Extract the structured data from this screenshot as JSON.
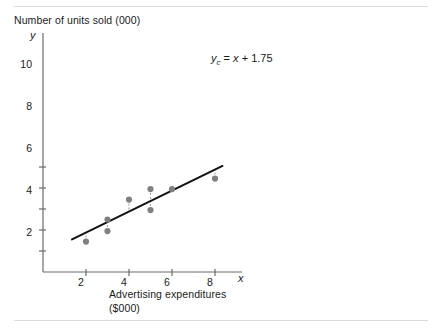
{
  "chart_data": {
    "type": "scatter",
    "title": "Number of units sold (000)",
    "xlabel": "Advertising expenditures",
    "xlabel_units": "($000)",
    "ylabel": "Number of units sold (000)",
    "x_axis_letter": "x",
    "y_axis_letter": "y",
    "xticks": [
      2,
      4,
      6,
      8
    ],
    "yticks": [
      2,
      4,
      6,
      8,
      10
    ],
    "xlim": [
      0,
      9.2
    ],
    "ylim": [
      0,
      11.2
    ],
    "grid": false,
    "legend": null,
    "annotations": [
      {
        "text": "yc = x + 1.75",
        "display": {
          "lead": "y",
          "sub": "c",
          "rest_eq": "=",
          "rest_var": "x",
          "rest_plus": "+",
          "rest_const": "1.75"
        },
        "x": 8.1,
        "y": 10.2
      }
    ],
    "points": [
      {
        "x": 2,
        "y": 2.9
      },
      {
        "x": 3,
        "y": 5.0
      },
      {
        "x": 3,
        "y": 3.9
      },
      {
        "x": 4,
        "y": 6.9
      },
      {
        "x": 5,
        "y": 7.9
      },
      {
        "x": 5,
        "y": 5.9
      },
      {
        "x": 6,
        "y": 7.9
      },
      {
        "x": 8,
        "y": 8.9
      }
    ],
    "fit_line": {
      "type": "line",
      "equation": "yc = x + 1.75",
      "slope": 1,
      "intercept": 1.75,
      "x_start": 1.35,
      "x_end": 8.35
    },
    "residual_lines": [
      {
        "x": 2,
        "y_point": 2.9,
        "y_line": 3.75
      },
      {
        "x": 3,
        "y_point": 5.0,
        "y_line": 4.75
      },
      {
        "x": 3,
        "y_point": 3.9,
        "y_line": 4.75
      },
      {
        "x": 4,
        "y_point": 6.9,
        "y_line": 5.75
      },
      {
        "x": 5,
        "y_point": 7.9,
        "y_line": 6.75
      },
      {
        "x": 5,
        "y_point": 5.9,
        "y_line": 6.75
      },
      {
        "x": 6,
        "y_point": 7.9,
        "y_line": 7.75
      },
      {
        "x": 8,
        "y_point": 8.9,
        "y_line": 9.75
      }
    ],
    "colors": {
      "line": "#111111",
      "point": "#808080",
      "residual": "#9a9a9a",
      "axis": "#6b6b6b",
      "text": "#1a1a1a",
      "rule": "#dcdcdc",
      "background": "#ffffff"
    }
  },
  "ticks": {
    "x": [
      "2",
      "4",
      "6",
      "8"
    ],
    "y": [
      "2",
      "4",
      "6",
      "8",
      "10"
    ]
  }
}
